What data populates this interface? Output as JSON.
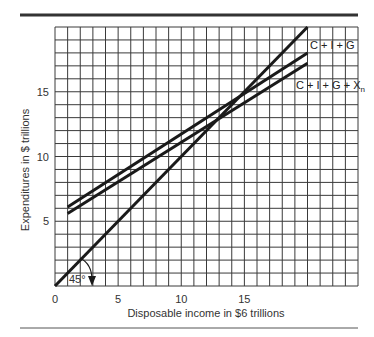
{
  "chart_data": {
    "type": "line",
    "title": "",
    "xlabel": "Disposable income in $6 trillions",
    "ylabel": "Expenditures in $ trillions",
    "xlim": [
      0,
      24
    ],
    "ylim": [
      0,
      20
    ],
    "grid": true,
    "x_ticks": [
      0,
      5,
      10,
      15
    ],
    "y_ticks": [
      5,
      10,
      15
    ],
    "legend_position": "inline-right",
    "series": [
      {
        "name": "45° line",
        "points": [
          [
            0,
            0
          ],
          [
            20,
            20
          ]
        ]
      },
      {
        "name": "C + I + G",
        "points": [
          [
            1,
            6.1
          ],
          [
            20,
            18
          ]
        ]
      },
      {
        "name": "C + I + G + Xn",
        "points": [
          [
            1,
            5.6
          ],
          [
            20,
            17.2
          ]
        ]
      }
    ],
    "annotations": [
      {
        "text": "45°",
        "x": 1.2,
        "y": 0.4,
        "note": "angle marker with curved arrow at origin"
      }
    ]
  },
  "labels": {
    "xlabel": "Disposable income in $6 trillions",
    "ylabel": "Expenditures in $ trillions",
    "angle": "45°",
    "series1": "C + I + G",
    "series2_main": "C + I + G + X",
    "series2_sub": "n"
  },
  "colors": {
    "line": "#1a1a1a",
    "grid": "#3a3a3a",
    "rule": "#333333"
  }
}
